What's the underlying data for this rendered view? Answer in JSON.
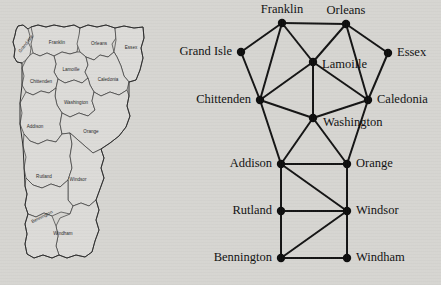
{
  "figure": {
    "background_color": "#d8d7d3",
    "ink_color": "#111111"
  },
  "map": {
    "name": "vermont-county-map",
    "title": "",
    "counties": [
      {
        "id": "grand-isle",
        "label": "Grand Isle",
        "label_x": 26,
        "label_y": 44,
        "rotation": -52
      },
      {
        "id": "franklin",
        "label": "Franklin",
        "label_x": 57,
        "label_y": 43,
        "rotation": 0
      },
      {
        "id": "orleans",
        "label": "Orleans",
        "label_x": 99,
        "label_y": 44,
        "rotation": 0
      },
      {
        "id": "essex",
        "label": "Essex",
        "label_x": 131,
        "label_y": 48,
        "rotation": 0
      },
      {
        "id": "lamoille",
        "label": "Lamoille",
        "label_x": 71,
        "label_y": 70,
        "rotation": 0
      },
      {
        "id": "chittenden",
        "label": "Chittenden",
        "label_x": 41,
        "label_y": 82,
        "rotation": 0
      },
      {
        "id": "caledonia",
        "label": "Caledonia",
        "label_x": 108,
        "label_y": 80,
        "rotation": 0
      },
      {
        "id": "washington",
        "label": "Washington",
        "label_x": 76,
        "label_y": 103,
        "rotation": 0
      },
      {
        "id": "addison",
        "label": "Addison",
        "label_x": 35,
        "label_y": 127,
        "rotation": 0
      },
      {
        "id": "orange",
        "label": "Orange",
        "label_x": 91,
        "label_y": 132,
        "rotation": 0
      },
      {
        "id": "rutland",
        "label": "Rutland",
        "label_x": 44,
        "label_y": 177,
        "rotation": 0
      },
      {
        "id": "windsor",
        "label": "Windsor",
        "label_x": 78,
        "label_y": 180,
        "rotation": 0
      },
      {
        "id": "bennington",
        "label": "Bennington",
        "label_x": 42,
        "label_y": 217,
        "rotation": -27
      },
      {
        "id": "windham",
        "label": "Windham",
        "label_x": 63,
        "label_y": 234,
        "rotation": 0
      }
    ]
  },
  "graph": {
    "name": "vermont-county-adjacency-graph",
    "type": "node-link-diagram",
    "node_radius": 4.2,
    "nodes": [
      {
        "id": "franklin",
        "label": "Franklin",
        "x": 114,
        "y": 23,
        "label_side": "above",
        "label_dx": 0,
        "label_dy": -13
      },
      {
        "id": "orleans",
        "label": "Orleans",
        "x": 178,
        "y": 24,
        "label_side": "above",
        "label_dx": 0,
        "label_dy": -13
      },
      {
        "id": "grand-isle",
        "label": "Grand Isle",
        "x": 73,
        "y": 52,
        "label_side": "left",
        "label_dx": -9,
        "label_dy": 0
      },
      {
        "id": "essex",
        "label": "Essex",
        "x": 220,
        "y": 53,
        "label_side": "right",
        "label_dx": 9,
        "label_dy": 0
      },
      {
        "id": "lamoille",
        "label": "Lamoille",
        "x": 145,
        "y": 62,
        "label_side": "right",
        "label_dx": 9,
        "label_dy": 3
      },
      {
        "id": "chittenden",
        "label": "Chittenden",
        "x": 92,
        "y": 100,
        "label_side": "left",
        "label_dx": -9,
        "label_dy": 0
      },
      {
        "id": "caledonia",
        "label": "Caledonia",
        "x": 200,
        "y": 100,
        "label_side": "right",
        "label_dx": 9,
        "label_dy": 0
      },
      {
        "id": "washington",
        "label": "Washington",
        "x": 145,
        "y": 118,
        "label_side": "right",
        "label_dx": 10,
        "label_dy": 5
      },
      {
        "id": "addison",
        "label": "Addison",
        "x": 113,
        "y": 164,
        "label_side": "left",
        "label_dx": -9,
        "label_dy": 0
      },
      {
        "id": "orange",
        "label": "Orange",
        "x": 179,
        "y": 164,
        "label_side": "right",
        "label_dx": 9,
        "label_dy": 0
      },
      {
        "id": "rutland",
        "label": "Rutland",
        "x": 113,
        "y": 211,
        "label_side": "left",
        "label_dx": -9,
        "label_dy": 0
      },
      {
        "id": "windsor",
        "label": "Windsor",
        "x": 179,
        "y": 211,
        "label_side": "right",
        "label_dx": 9,
        "label_dy": 0
      },
      {
        "id": "bennington",
        "label": "Bennington",
        "x": 113,
        "y": 258,
        "label_side": "left",
        "label_dx": -9,
        "label_dy": 0
      },
      {
        "id": "windham",
        "label": "Windham",
        "x": 179,
        "y": 258,
        "label_side": "right",
        "label_dx": 9,
        "label_dy": 0
      }
    ],
    "edges": [
      [
        "franklin",
        "orleans"
      ],
      [
        "franklin",
        "grand-isle"
      ],
      [
        "franklin",
        "lamoille"
      ],
      [
        "franklin",
        "chittenden"
      ],
      [
        "grand-isle",
        "chittenden"
      ],
      [
        "orleans",
        "lamoille"
      ],
      [
        "orleans",
        "essex"
      ],
      [
        "orleans",
        "caledonia"
      ],
      [
        "essex",
        "caledonia"
      ],
      [
        "lamoille",
        "chittenden"
      ],
      [
        "lamoille",
        "caledonia"
      ],
      [
        "lamoille",
        "washington"
      ],
      [
        "chittenden",
        "washington"
      ],
      [
        "chittenden",
        "addison"
      ],
      [
        "caledonia",
        "washington"
      ],
      [
        "caledonia",
        "orange"
      ],
      [
        "washington",
        "addison"
      ],
      [
        "washington",
        "orange"
      ],
      [
        "addison",
        "orange"
      ],
      [
        "addison",
        "rutland"
      ],
      [
        "addison",
        "windsor"
      ],
      [
        "orange",
        "windsor"
      ],
      [
        "rutland",
        "windsor"
      ],
      [
        "rutland",
        "bennington"
      ],
      [
        "windsor",
        "bennington"
      ],
      [
        "windsor",
        "windham"
      ],
      [
        "bennington",
        "windham"
      ]
    ]
  }
}
